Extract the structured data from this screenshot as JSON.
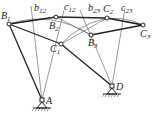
{
  "diagram": {
    "type": "four-bar linkage graphical synthesis",
    "points": {
      "B1": {
        "label": "B",
        "sub": "1",
        "x": 9,
        "y": 24
      },
      "B2": {
        "label": "B",
        "sub": "2",
        "x": 56,
        "y": 17
      },
      "B3": {
        "label": "B",
        "sub": "3",
        "x": 91,
        "y": 35
      },
      "C1": {
        "label": "C",
        "sub": "1",
        "x": 61,
        "y": 44
      },
      "C2": {
        "label": "C",
        "sub": "2",
        "x": 107,
        "y": 18
      },
      "C3": {
        "label": "C",
        "sub": "3",
        "x": 143,
        "y": 25
      },
      "A": {
        "label": "A",
        "x": 42,
        "y": 100
      },
      "D": {
        "label": "D",
        "x": 112,
        "y": 86
      }
    },
    "bisectors": {
      "b12": {
        "label": "b",
        "sub": "12"
      },
      "b23": {
        "label": "b",
        "sub": "23"
      },
      "c12": {
        "label": "c",
        "sub": "12"
      },
      "c23": {
        "label": "c",
        "sub": "23"
      }
    },
    "colors": {
      "line": "#222222",
      "thin": "#555555",
      "background": "#ffffff"
    }
  }
}
